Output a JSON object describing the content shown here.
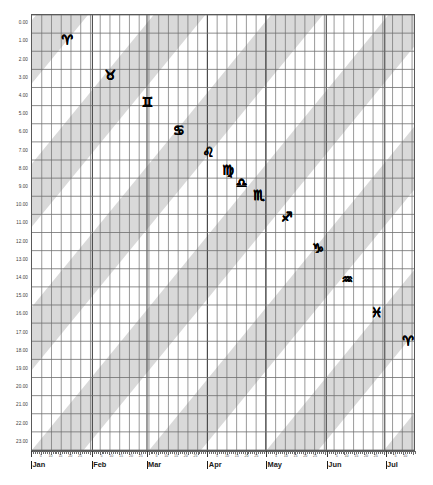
{
  "chart_data": {
    "type": "scatter",
    "title": "",
    "xlabel": "",
    "ylabel": "",
    "grid": true,
    "legend": false,
    "xlim": [
      "Jan 1",
      "Jul 15"
    ],
    "ylim": [
      0,
      23
    ],
    "y_tick_labels": [
      "0.00",
      "1.00",
      "2.00",
      "3.00",
      "4.00",
      "5.00",
      "6.00",
      "7.00",
      "8.00",
      "9.00",
      "10.00",
      "11.00",
      "12.00",
      "13.00",
      "14.00",
      "15.00",
      "16.00",
      "17.00",
      "18.00",
      "19.00",
      "20.00",
      "21.00",
      "22.00",
      "23.00"
    ],
    "y_tick_values": [
      0,
      1,
      2,
      3,
      4,
      5,
      6,
      7,
      8,
      9,
      10,
      11,
      12,
      13,
      14,
      15,
      16,
      17,
      18,
      19,
      20,
      21,
      22,
      23
    ],
    "x_months": [
      {
        "label": "Jan",
        "day_of_year": 0
      },
      {
        "label": "Feb",
        "day_of_year": 31
      },
      {
        "label": "Mar",
        "day_of_year": 59
      },
      {
        "label": "Apr",
        "day_of_year": 90
      },
      {
        "label": "May",
        "day_of_year": 120
      },
      {
        "label": "Jun",
        "day_of_year": 151
      },
      {
        "label": "Jul",
        "day_of_year": 181
      }
    ],
    "x_day_ticks": [
      5,
      10,
      15,
      20,
      25
    ],
    "x_day_tick_labels": [
      "5",
      "10",
      "15",
      "20",
      "25"
    ],
    "series": [
      {
        "name": "zodiac-ingress",
        "points": [
          {
            "glyph": "♈",
            "name": "aries",
            "day_of_year": 18,
            "hour": 0.9
          },
          {
            "glyph": "♉",
            "name": "taurus",
            "day_of_year": 40,
            "hour": 2.8
          },
          {
            "glyph": "♊",
            "name": "gemini",
            "day_of_year": 59,
            "hour": 4.3
          },
          {
            "glyph": "♋",
            "name": "cancer",
            "day_of_year": 75,
            "hour": 5.8
          },
          {
            "glyph": "♌",
            "name": "leo",
            "day_of_year": 90,
            "hour": 7.0
          },
          {
            "glyph": "♍",
            "name": "virgo",
            "day_of_year": 100,
            "hour": 8.0
          },
          {
            "glyph": "♎",
            "name": "libra",
            "day_of_year": 107,
            "hour": 8.7
          },
          {
            "glyph": "♏",
            "name": "scorpio",
            "day_of_year": 116,
            "hour": 9.4
          },
          {
            "glyph": "♐",
            "name": "sagittarius",
            "day_of_year": 130,
            "hour": 10.6
          },
          {
            "glyph": "♑",
            "name": "capricorn",
            "day_of_year": 146,
            "hour": 12.3
          },
          {
            "glyph": "♒",
            "name": "aquarius",
            "day_of_year": 161,
            "hour": 14.0
          },
          {
            "glyph": "♓",
            "name": "pisces",
            "day_of_year": 176,
            "hour": 15.8
          },
          {
            "glyph": "♈",
            "name": "aries",
            "day_of_year": 192,
            "hour": 17.4
          },
          {
            "glyph": "♉",
            "name": "taurus",
            "day_of_year": 205,
            "hour": 18.8
          },
          {
            "glyph": "♊",
            "name": "gemini",
            "day_of_year": 218,
            "hour": 20.0
          },
          {
            "glyph": "♋",
            "name": "cancer",
            "day_of_year": 228,
            "hour": 21.2
          },
          {
            "glyph": "♌",
            "name": "leo",
            "day_of_year": 239,
            "hour": 22.1
          },
          {
            "glyph": "♍",
            "name": "virgo",
            "day_of_year": 248,
            "hour": 23.1
          }
        ]
      }
    ],
    "bands": {
      "description": "diagonal shaded stripes running lower-left to upper-right",
      "color": "#d9d9d9",
      "count": 8
    },
    "colors": {
      "grid": "#6e6e6e",
      "band": "#d9d9d9",
      "axis": "#5a5a5a",
      "glyph": "#000000",
      "background": "#ffffff"
    }
  }
}
